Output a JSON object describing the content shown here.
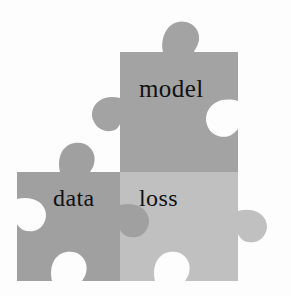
{
  "figure": {
    "name": "jigsaw-puzzle-diagram",
    "background_color": "#fdfdfd"
  },
  "pieces": [
    {
      "id": "model",
      "label": "model",
      "fill": "#a3a3a3",
      "shadow_fill": "#9a9a9a",
      "role": "top-piece"
    },
    {
      "id": "data",
      "label": "data",
      "fill": "#a0a0a0",
      "shadow_fill": "#979797",
      "role": "bottom-left-piece"
    },
    {
      "id": "loss",
      "label": "loss",
      "fill": "#c0c0c0",
      "shadow_fill": "#b5b5b5",
      "role": "bottom-right-piece"
    }
  ],
  "labels": {
    "model": "model",
    "data": "data",
    "loss": "loss"
  },
  "colors": {
    "model_gray": "#a3a3a3",
    "data_gray": "#a0a0a0",
    "loss_gray": "#c0c0c0",
    "notch_white": "#fdfdfd",
    "text_black": "#111111"
  }
}
